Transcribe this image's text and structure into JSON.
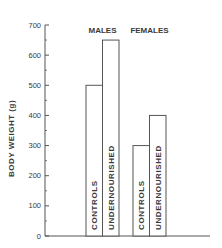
{
  "chart_data": {
    "type": "bar",
    "title": "",
    "xlabel": "",
    "ylabel": "BODY WEIGHT (g)",
    "ylim": [
      0,
      700
    ],
    "yticks": [
      0,
      100,
      200,
      300,
      400,
      500,
      600,
      700
    ],
    "grid": false,
    "legend": "none",
    "groups": [
      {
        "name": "MALES",
        "bars": [
          {
            "label": "CONTROLS",
            "value": 500
          },
          {
            "label": "UNDERNOURISHED",
            "value": 650
          }
        ]
      },
      {
        "name": "FEMALES",
        "bars": [
          {
            "label": "CONTROLS",
            "value": 300
          },
          {
            "label": "UNDERNOURISHED",
            "value": 400
          }
        ]
      }
    ],
    "categories": [
      "CONTROLS",
      "UNDERNOURISHED"
    ],
    "series": [
      {
        "name": "MALES",
        "values": [
          500,
          650
        ]
      },
      {
        "name": "FEMALES",
        "values": [
          300,
          400
        ]
      }
    ]
  },
  "colors": {
    "axis": "#555555",
    "bar_stroke": "#555555",
    "bar_fill": "#ffffff",
    "text": "#3a3a3a"
  }
}
